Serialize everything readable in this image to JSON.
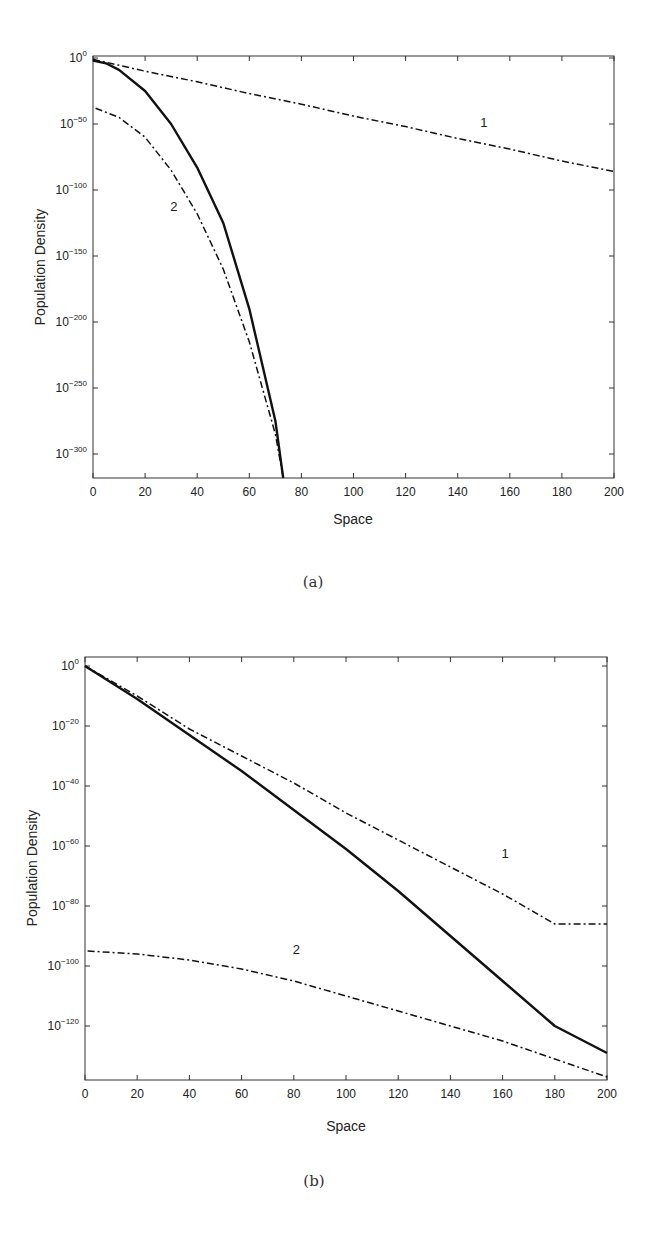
{
  "chart_data": [
    {
      "type": "line",
      "panel_caption": "(a)",
      "xlabel": "Space",
      "ylabel": "Population Density",
      "yscale": "log",
      "xlim": [
        0,
        200
      ],
      "ylim_exponent": [
        -318,
        0
      ],
      "x_ticks": [
        0,
        20,
        40,
        60,
        80,
        100,
        120,
        140,
        160,
        180,
        200
      ],
      "y_ticks_exponent": [
        0,
        -50,
        -100,
        -150,
        -200,
        -250,
        -300
      ],
      "y_tick_labels": [
        "10^0",
        "10^-50",
        "10^-100",
        "10^-150",
        "10^-200",
        "10^-250",
        "10^-300"
      ],
      "grid": false,
      "series": [
        {
          "name": "solid",
          "style": "solid",
          "label": "",
          "x": [
            0,
            5,
            10,
            20,
            30,
            40,
            50,
            60,
            70,
            73
          ],
          "log10_y": [
            -2,
            -4,
            -9,
            -25,
            -50,
            -83,
            -125,
            -190,
            -275,
            -318
          ]
        },
        {
          "name": "curve 1",
          "style": "dashdot",
          "label": "1",
          "x": [
            0,
            20,
            40,
            60,
            80,
            100,
            120,
            140,
            160,
            180,
            200
          ],
          "log10_y": [
            -1,
            -10,
            -18,
            -27,
            -35,
            -44,
            -52,
            -61,
            -69,
            -78,
            -86
          ]
        },
        {
          "name": "curve 2",
          "style": "dashdot",
          "label": "2",
          "x": [
            1,
            10,
            20,
            30,
            40,
            50,
            60,
            70,
            73
          ],
          "log10_y": [
            -38,
            -45,
            -60,
            -85,
            -118,
            -160,
            -215,
            -285,
            -318
          ]
        }
      ],
      "annotations": [
        {
          "text": "1",
          "x": 150,
          "log10_y": -52
        },
        {
          "text": "2",
          "x": 31,
          "log10_y": -116
        }
      ]
    },
    {
      "type": "line",
      "panel_caption": "(b)",
      "xlabel": "Space",
      "ylabel": "Population Density",
      "yscale": "log",
      "xlim": [
        0,
        200
      ],
      "ylim_exponent": [
        -138,
        3
      ],
      "x_ticks": [
        0,
        20,
        40,
        60,
        80,
        100,
        120,
        140,
        160,
        180,
        200
      ],
      "y_ticks_exponent": [
        0,
        -20,
        -40,
        -60,
        -80,
        -100,
        -120
      ],
      "y_tick_labels": [
        "10^0",
        "10^-20",
        "10^-40",
        "10^-60",
        "10^-80",
        "10^-100",
        "10^-120"
      ],
      "grid": false,
      "series": [
        {
          "name": "solid",
          "style": "solid",
          "label": "",
          "x": [
            0,
            20,
            40,
            60,
            80,
            100,
            120,
            140,
            160,
            180,
            200
          ],
          "log10_y": [
            0,
            -11,
            -23,
            -35,
            -48,
            -61,
            -75,
            -90,
            -105,
            -120,
            -129
          ]
        },
        {
          "name": "curve 1",
          "style": "dashdot",
          "label": "1",
          "x": [
            0,
            20,
            40,
            60,
            80,
            100,
            120,
            140,
            160,
            180,
            200
          ],
          "log10_y": [
            0,
            -10,
            -21,
            -30,
            -39,
            -49,
            -58,
            -67,
            -76,
            -86,
            -86
          ]
        },
        {
          "name": "curve 2",
          "style": "dashdot",
          "label": "2",
          "x": [
            1,
            20,
            40,
            60,
            80,
            100,
            120,
            140,
            160,
            180,
            200
          ],
          "log10_y": [
            -95,
            -96,
            -98,
            -101,
            -105,
            -110,
            -115,
            -120,
            -125,
            -131,
            -137
          ]
        }
      ],
      "annotations": [
        {
          "text": "1",
          "x": 161,
          "log10_y": -64
        },
        {
          "text": "2",
          "x": 81,
          "log10_y": -96
        }
      ]
    }
  ],
  "figure": {
    "caption_a": "(a)",
    "caption_b": "(b)",
    "xlabel_a": "Space",
    "xlabel_b": "Space",
    "ylabel_a": "Population Density",
    "ylabel_b": "Population Density"
  }
}
